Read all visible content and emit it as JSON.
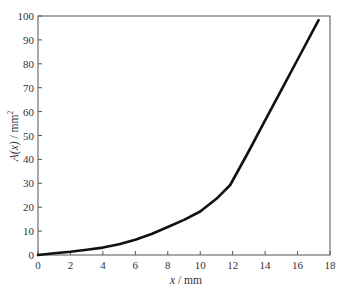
{
  "chart_data": {
    "type": "line",
    "title": "",
    "xlabel": "x / mm",
    "ylabel": "A(x) / mm²",
    "xlabel_parts": {
      "var": "x",
      "unit": " / mm"
    },
    "ylabel_parts": {
      "var": "A(x)",
      "unit": " / mm",
      "sup": "2"
    },
    "xlim": [
      0,
      18
    ],
    "ylim": [
      0,
      100
    ],
    "xticks": [
      0,
      2,
      4,
      6,
      8,
      10,
      12,
      14,
      16,
      18
    ],
    "yticks": [
      0,
      10,
      20,
      30,
      40,
      50,
      60,
      70,
      80,
      90,
      100
    ],
    "grid": false,
    "legend": null,
    "series": [
      {
        "name": "A(x)",
        "color": "#111111",
        "x": [
          0,
          1,
          2,
          3,
          4,
          5,
          6,
          7,
          8,
          9,
          10,
          11,
          11.85,
          13,
          14,
          15,
          16,
          17.3
        ],
        "y": [
          0,
          0.7,
          1.4,
          2.2,
          3.1,
          4.5,
          6.4,
          8.8,
          11.7,
          14.7,
          18.2,
          23.5,
          29.3,
          43.5,
          56.3,
          69.0,
          81.8,
          98.3
        ]
      }
    ]
  }
}
